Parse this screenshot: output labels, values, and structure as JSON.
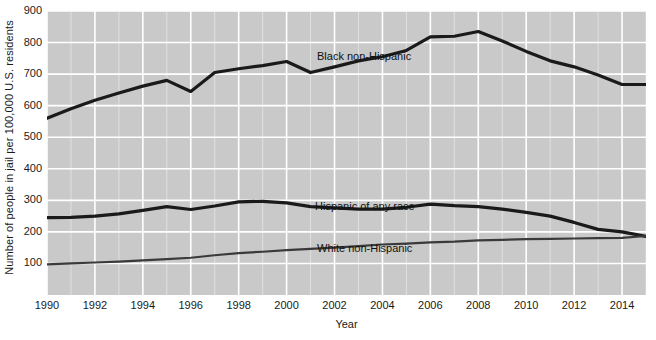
{
  "chart_data": {
    "type": "line",
    "title": "",
    "xlabel": "Year",
    "ylabel": "Number of people in jail per 100,000 U.S. residents",
    "xlim": [
      1990,
      2015
    ],
    "ylim": [
      0,
      900
    ],
    "grid": true,
    "legend_position": "inline-annotations",
    "plot_background": "#c9c9c9",
    "gridline_color": "#ffffff",
    "x": [
      1990,
      1991,
      1992,
      1993,
      1994,
      1995,
      1996,
      1997,
      1998,
      1999,
      2000,
      2001,
      2002,
      2003,
      2004,
      2005,
      2006,
      2007,
      2008,
      2009,
      2010,
      2011,
      2012,
      2013,
      2014,
      2015
    ],
    "xticks": [
      "1990",
      "1992",
      "1994",
      "1996",
      "1998",
      "2000",
      "2002",
      "2004",
      "2006",
      "2008",
      "2010",
      "2012",
      "2014"
    ],
    "yticks": [
      "100",
      "200",
      "300",
      "400",
      "500",
      "600",
      "700",
      "800",
      "900"
    ],
    "series": [
      {
        "name": "Black non-Hispanic",
        "color": "#1a1a1a",
        "width": 3.2,
        "values": [
          560,
          590,
          617,
          640,
          662,
          680,
          645,
          705,
          717,
          727,
          740,
          705,
          723,
          742,
          755,
          775,
          818,
          820,
          835,
          805,
          772,
          742,
          723,
          697,
          667,
          667
        ]
      },
      {
        "name": "Hispanic of any race",
        "color": "#1a1a1a",
        "width": 3.2,
        "values": [
          245,
          246,
          250,
          257,
          268,
          280,
          271,
          282,
          295,
          297,
          292,
          280,
          276,
          272,
          272,
          278,
          288,
          283,
          280,
          272,
          262,
          250,
          230,
          208,
          200,
          186
        ]
      },
      {
        "name": "White non-Hispanic",
        "color": "#3a3a3a",
        "width": 2.2,
        "values": [
          97,
          100,
          103,
          106,
          110,
          114,
          118,
          126,
          133,
          137,
          142,
          146,
          150,
          155,
          160,
          163,
          167,
          169,
          173,
          175,
          177,
          178,
          179,
          180,
          181,
          187
        ]
      }
    ],
    "annotations": [
      {
        "text": "Black non-Hispanic",
        "x": 2000,
        "y": 790
      },
      {
        "text": "Hispanic of any race",
        "x": 2000,
        "y": 345
      },
      {
        "text": "White non-Hispanic",
        "x": 2000,
        "y": 210
      }
    ]
  }
}
